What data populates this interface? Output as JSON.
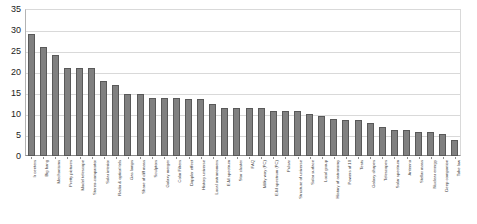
{
  "chart_data": {
    "type": "bar",
    "title": "",
    "subtitle": "",
    "xlabel": "",
    "ylabel": "",
    "ylim": [
      0,
      35
    ],
    "ytick_step": 5,
    "yticks": [
      0,
      5,
      10,
      15,
      20,
      25,
      30,
      35
    ],
    "ytick_labels": [
      "0",
      "5",
      "10",
      "15",
      "20",
      "25",
      "30",
      "35"
    ],
    "grid": true,
    "grid_axis": "y",
    "legend": false,
    "legend_position": "none",
    "bar_color": "#808080",
    "bar_edge_color": "#595959",
    "orientation": "vertical",
    "sorted": "descending",
    "categories": [
      "Ir centers",
      "Big bang",
      "Mechanisms",
      "Pretty pictures",
      "Model telescope",
      "Stereo-comparator",
      "Solar interior",
      "Radio & optical tels",
      "Gas lamps",
      "Share of diff mass",
      "Sculptors",
      "Galaxy merger",
      "Color Filters",
      "Doppler effect",
      "History universe",
      "Local astronomers",
      "E-M spectrum",
      "Star cluster",
      "FAQ",
      "Milky way (PC)",
      "E-M spectrum (PC)",
      "Pulsar",
      "Structure of universe",
      "Solar surface",
      "Local group",
      "History of astronomy",
      "Powers of 10",
      "Tests",
      "Galaxy shapes",
      "Telescopes",
      "Solar spectrum",
      "Antenna",
      "Stellar mass",
      "Nuclear energy",
      "Deep companion",
      "Take law"
    ],
    "values": [
      29,
      26,
      24,
      21,
      21,
      21,
      17.8,
      16.8,
      14.8,
      14.8,
      13.8,
      13.8,
      13.8,
      13.5,
      13.5,
      12.5,
      11.5,
      11.5,
      11.5,
      11.5,
      10.8,
      10.8,
      10.8,
      10,
      9.5,
      8.8,
      8.5,
      8.5,
      7.8,
      7,
      6.2,
      6.2,
      5.8,
      5.8,
      5.2,
      3.8
    ],
    "series": [
      {
        "name": "Count",
        "values": [
          29,
          26,
          24,
          21,
          21,
          21,
          17.8,
          16.8,
          14.8,
          14.8,
          13.8,
          13.8,
          13.8,
          13.5,
          13.5,
          12.5,
          11.5,
          11.5,
          11.5,
          11.5,
          10.8,
          10.8,
          10.8,
          10,
          9.5,
          8.8,
          8.5,
          8.5,
          7.8,
          7,
          6.2,
          6.2,
          5.8,
          5.8,
          5.2,
          3.8
        ]
      }
    ]
  }
}
